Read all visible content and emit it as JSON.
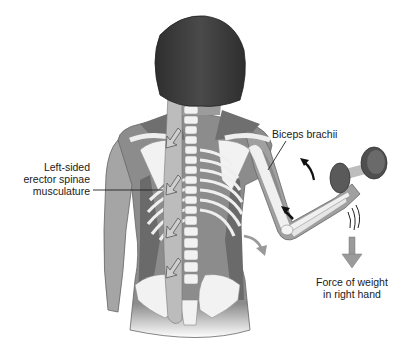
{
  "figure": {
    "colors": {
      "background": "#ffffff",
      "hair": "#3a3a3a",
      "skin": "#9a9a9a",
      "muscle": "#7d7d7d",
      "bone": "#eeeeee",
      "bone_outline": "#8a8a8a",
      "erector_spinae": "#b9b9b9",
      "dumbbell": "#555555",
      "arrow_dark": "#111111",
      "arrow_gray": "#888888",
      "leader_line": "#222222",
      "text": "#1a1a1a"
    }
  },
  "labels": {
    "erector": {
      "lines": [
        "Left-sided",
        "erector spinae",
        "musculature"
      ]
    },
    "biceps": {
      "text": "Biceps brachii"
    },
    "force": {
      "lines": [
        "Force of weight",
        "in right hand"
      ]
    }
  },
  "arrows": {
    "erector_down_arrows": 4,
    "biceps_contraction_arrow": "dark-diagonal",
    "forearm_rotation_arrow": "dark-curved",
    "torso_rotation_arrow": "gray-curved",
    "weight_force_arrow": "gray-down",
    "vibration_marks": 3
  }
}
